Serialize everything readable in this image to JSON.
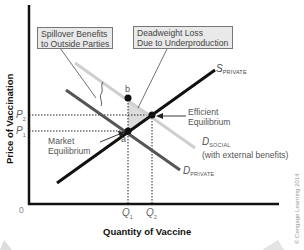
{
  "diagram": {
    "y_axis_label": "Price of Vaccination",
    "x_axis_label": "Quantity of Vaccine",
    "origin_label": "0",
    "ticks": {
      "p2": {
        "main": "P",
        "sub": "2"
      },
      "p1": {
        "main": "P",
        "sub": "1"
      },
      "q1": {
        "main": "Q",
        "sub": "1"
      },
      "q2": {
        "main": "Q",
        "sub": "2"
      }
    },
    "callouts": {
      "spillover": {
        "line1": "Spillover Benefits",
        "line2": "to Outside Parties"
      },
      "deadweight": {
        "line1": "Deadweight Loss",
        "line2": "Due to Underproduction"
      }
    },
    "curves": {
      "s_private": {
        "main": "S",
        "sub": "PRIVATE"
      },
      "d_social": {
        "main": "D",
        "sub": "SOCIAL",
        "note": "(with external benefits)"
      },
      "d_private": {
        "main": "D",
        "sub": "PRIVATE"
      }
    },
    "points": {
      "a": "a",
      "b": "b",
      "market_eq": {
        "line1": "Market",
        "line2": "Equilibrium"
      },
      "efficient_eq": {
        "line1": "Efficient",
        "line2": "Equilibrium"
      }
    },
    "copyright": "© Cengage Learning 2014",
    "colors": {
      "supply": "#111111",
      "demand_private": "#555555",
      "demand_social": "#cccccc",
      "deadweight_area": "#dcdcdc",
      "box_fill": "#e9e9e9"
    }
  }
}
